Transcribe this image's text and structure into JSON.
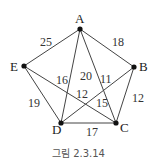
{
  "caption": "그림 2.3.14",
  "vertices": [
    {
      "id": "A",
      "label": "A",
      "x": 80,
      "y": 29
    },
    {
      "id": "B",
      "label": "B",
      "x": 134,
      "y": 67
    },
    {
      "id": "C",
      "label": "C",
      "x": 116,
      "y": 123
    },
    {
      "id": "D",
      "label": "D",
      "x": 61,
      "y": 123
    },
    {
      "id": "E",
      "label": "E",
      "x": 24,
      "y": 66
    }
  ],
  "edges": [
    {
      "from": "A",
      "to": "E",
      "weight": "25",
      "lx": 47,
      "ly": 45
    },
    {
      "from": "A",
      "to": "B",
      "weight": "18",
      "lx": 117,
      "ly": 46
    },
    {
      "from": "B",
      "to": "C",
      "weight": "12",
      "lx": 134,
      "ly": 102
    },
    {
      "from": "C",
      "to": "D",
      "weight": "17",
      "lx": 89,
      "ly": 135
    },
    {
      "from": "D",
      "to": "E",
      "weight": "19",
      "lx": 33,
      "ly": 107
    },
    {
      "from": "A",
      "to": "D",
      "weight": "16",
      "lx": 61,
      "ly": 82
    },
    {
      "from": "A",
      "to": "C",
      "weight": "11",
      "lx": 106,
      "ly": 81
    },
    {
      "from": "A",
      "to": "C2",
      "weight": "20",
      "lx": 85,
      "ly": 78
    },
    {
      "from": "E",
      "to": "C",
      "weight": "12",
      "lx": 80,
      "ly": 97
    },
    {
      "from": "B",
      "to": "D",
      "weight": "15",
      "lx": 100,
      "ly": 107
    }
  ]
}
